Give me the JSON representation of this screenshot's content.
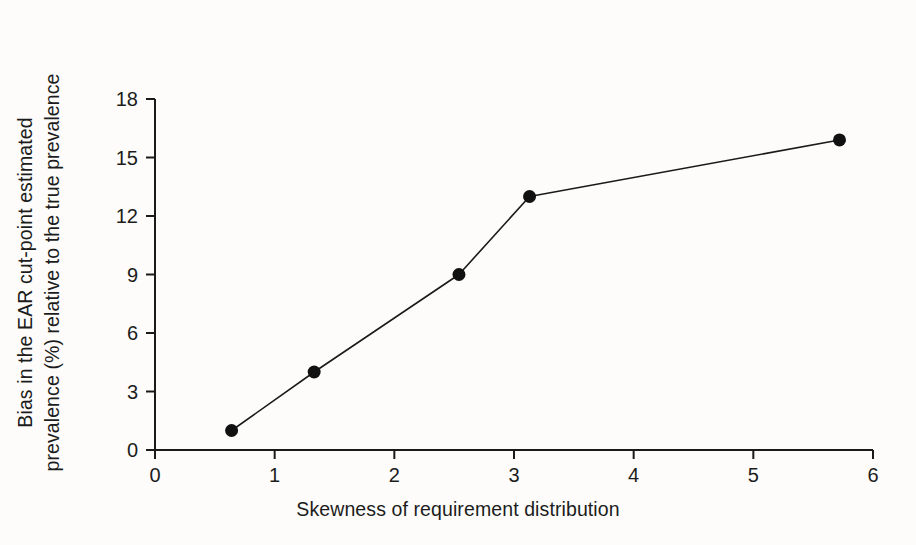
{
  "chart_data": {
    "type": "line",
    "title": "",
    "xlabel": "Skewness of requirement distribution",
    "ylabel": "Bias in the EAR cut-point estimated prevalence (%) relative to the true prevalence",
    "ylabel_lines": [
      "Bias in the EAR cut-point estimated",
      "prevalence (%) relative to the true prevalence"
    ],
    "x": [
      0.64,
      1.33,
      2.54,
      3.13,
      5.72
    ],
    "values": [
      1.0,
      4.0,
      9.0,
      13.0,
      15.9
    ],
    "points": [
      {
        "x": 0.64,
        "y": 1.0
      },
      {
        "x": 1.33,
        "y": 4.0
      },
      {
        "x": 2.54,
        "y": 9.0
      },
      {
        "x": 3.13,
        "y": 13.0
      },
      {
        "x": 5.72,
        "y": 15.9
      }
    ],
    "xlim": [
      0,
      6
    ],
    "ylim": [
      0,
      18
    ],
    "xticks": [
      0,
      1,
      2,
      3,
      4,
      5,
      6
    ],
    "xtick_labels": [
      "0",
      "1",
      "2",
      "3",
      "4",
      "5",
      "6"
    ],
    "yticks": [
      0,
      3,
      6,
      9,
      12,
      15,
      18
    ],
    "ytick_labels": [
      "0",
      "3",
      "6",
      "9",
      "12",
      "15",
      "18"
    ],
    "grid": false,
    "legend": null,
    "marker": "filled-circle",
    "marker_color": "#111111",
    "line_color": "#1a1a1a",
    "line_width": 1.6,
    "background_color": "#fdfcfa",
    "axis_color": "#1a1a1a",
    "spines": [
      "left",
      "bottom"
    ]
  }
}
